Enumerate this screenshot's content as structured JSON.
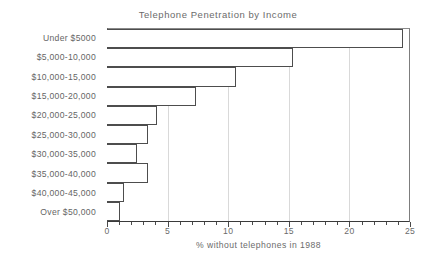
{
  "chart_data": {
    "type": "bar",
    "orientation": "horizontal",
    "title": "Telephone Penetration by Income",
    "xlabel": "% without telephones in 1988",
    "ylabel": "",
    "xlim": [
      0,
      25
    ],
    "xticks": [
      0,
      5,
      10,
      15,
      20,
      25
    ],
    "xtick_labels": [
      "0",
      "5",
      "10",
      "15",
      "20",
      "25"
    ],
    "minor_tick_step": 1,
    "grid": "vertical-gridlines-at-major-ticks",
    "legend": "none",
    "categories": [
      "Under $5000",
      "$5,000-10,000",
      "$10,000-15,000",
      "$15,000-20,000",
      "$20,000-25,000",
      "$25,000-30,000",
      "$30,000-35,000",
      "$35,000-40,000",
      "$40,000-45,000",
      "Over $50,000"
    ],
    "values": [
      24.5,
      15.4,
      10.6,
      7.3,
      4.1,
      3.3,
      2.4,
      3.3,
      1.3,
      1.0
    ],
    "bar_fill": "#ffffff",
    "bar_edge": "#4d4d4d",
    "background": "#ffffff"
  }
}
